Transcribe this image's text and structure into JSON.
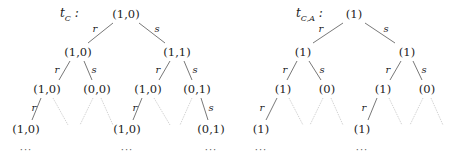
{
  "trees": [
    {
      "name": "t_C",
      "title_main": "t",
      "title_sub": "C",
      "title_suffix": " :",
      "nodes": {
        "root": "(1,0)",
        "l": "(1,0)",
        "r": "(1,1)",
        "ll": "(1,0)",
        "ls": "(0,0)",
        "rl": "(1,0)",
        "rs": "(0,1)",
        "lll": "(1,0)",
        "rll": "(1,0)",
        "rss": "(0,1)"
      },
      "edge_labels": {
        "r": "r",
        "s": "s"
      },
      "ellipsis": "···"
    },
    {
      "name": "t_{C,A}",
      "title_main": "t",
      "title_sub": "C,A",
      "title_suffix": " :",
      "nodes": {
        "root": "(1)",
        "l": "(1)",
        "r": "(1)",
        "ll": "(1)",
        "ls": "(0)",
        "rl": "(1)",
        "rs": "(0)",
        "lll": "(1)",
        "rll": "(1)"
      },
      "edge_labels": {
        "r": "r",
        "s": "s"
      },
      "ellipsis": "···"
    }
  ],
  "colors": {
    "edge": "#555555",
    "faded_edge": "#c8c8c8",
    "text": "#222222"
  }
}
